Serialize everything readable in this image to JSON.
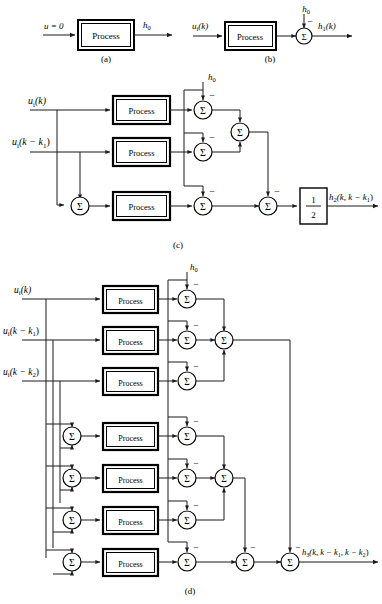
{
  "figure": {
    "type": "block-diagram",
    "process_block_label": "Process",
    "sum_symbol": "Σ",
    "minus_sign": "−"
  },
  "panels": [
    {
      "id": "a",
      "caption": "(a)",
      "inputs": [
        "u = 0"
      ],
      "outputs": [
        "h0"
      ],
      "process_count": 1,
      "sum_count": 0
    },
    {
      "id": "b",
      "caption": "(b)",
      "inputs": [
        "ui(k)"
      ],
      "subtrahends": [
        "h0"
      ],
      "outputs": [
        "h1(k)"
      ],
      "process_count": 1,
      "sum_count": 1
    },
    {
      "id": "c",
      "caption": "(c)",
      "inputs": [
        "ui(k)",
        "ui(k − k1)"
      ],
      "subtrahends": [
        "h0"
      ],
      "outputs": [
        "h2(k, k − k1)"
      ],
      "gain_numerator": "1",
      "gain_denominator": "2",
      "process_count": 3,
      "sum_count": 6
    },
    {
      "id": "d",
      "caption": "(d)",
      "inputs": [
        "ui(k)",
        "ui(k − k1)",
        "ui(k − k2)"
      ],
      "subtrahends": [
        "h0"
      ],
      "outputs": [
        "h3(k, k − k1, k − k2)"
      ],
      "process_count": 7,
      "sum_count": 14
    }
  ],
  "labels": {
    "u_zero": "u = 0",
    "h0": "h",
    "h0_sub": "0",
    "ui_k": "u",
    "ui_sub": "i",
    "of_k": "(k)",
    "h1": "h",
    "h1_sub": "1",
    "h1_arg": "(k)",
    "k_minus_k1": "(k − k",
    "k1_sub": "1",
    "close_paren": ")",
    "k_minus_k2": "(k − k",
    "k2_sub": "2",
    "h2": "h",
    "h2_sub": "2",
    "h2_arg": "(k, k − k",
    "h3": "h",
    "h3_sub": "3",
    "h3_arg": "(k, k − k",
    "h3_arg2": ", k − k",
    "process": "Process",
    "sigma": "Σ",
    "minus": "−",
    "one": "1",
    "two": "2",
    "cap_a": "(a)",
    "cap_b": "(b)",
    "cap_c": "(c)",
    "cap_d": "(d)"
  },
  "colors": {
    "line": "#1a1a1a",
    "block_border": "#000000",
    "background": "#ffffff",
    "text": "#000000"
  }
}
